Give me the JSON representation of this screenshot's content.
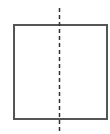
{
  "diagram": {
    "canvas": {
      "width": 110,
      "height": 134,
      "background": "#ffffff"
    },
    "shapes": [
      {
        "id": "square",
        "type": "rect",
        "x": 14,
        "y": 25,
        "width": 93,
        "height": 94,
        "stroke": "#555555",
        "stroke_width": 2,
        "fill": "none"
      },
      {
        "id": "symmetry-line",
        "type": "line",
        "style": "dashed",
        "x1": 59.5,
        "y1": 8,
        "x2": 59.5,
        "y2": 134,
        "stroke": "#333333",
        "stroke_width": 1.5,
        "dash": "4 3"
      }
    ]
  }
}
